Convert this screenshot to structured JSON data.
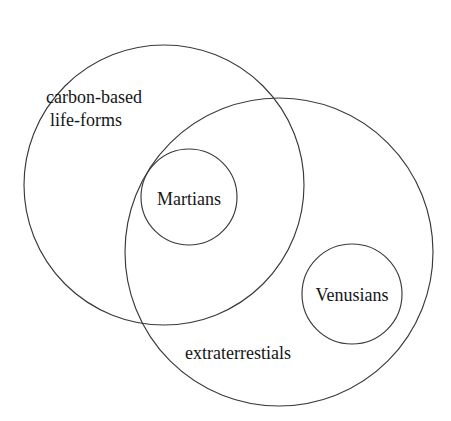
{
  "diagram": {
    "type": "euler-diagram",
    "title": "",
    "background_color": "#ffffff",
    "stroke_color": "#3a3a3a",
    "text_color": "#151515",
    "canvas": {
      "width": 451,
      "height": 421
    },
    "sets": [
      {
        "id": "carbon-based-life-forms",
        "label_lines": [
          "carbon-based",
          "life-forms"
        ],
        "label_text": "carbon-based life-forms",
        "cx": 164,
        "cy": 185,
        "r": 140,
        "label_x": 46,
        "label_y": 86
      },
      {
        "id": "extraterrestials",
        "label_lines": [
          "extraterrestials"
        ],
        "label_text": "extraterrestials",
        "cx": 279,
        "cy": 252,
        "r": 154,
        "label_x": 185,
        "label_y": 342
      },
      {
        "id": "martians",
        "label_lines": [
          "Martians"
        ],
        "label_text": "Martians",
        "cx": 189,
        "cy": 197,
        "r": 48,
        "label_x": 141,
        "label_y": 188
      },
      {
        "id": "venusians",
        "label_lines": [
          "Venusians"
        ],
        "label_text": "Venusians",
        "cx": 352,
        "cy": 294,
        "r": 50,
        "label_x": 300,
        "label_y": 284
      }
    ],
    "relations": [
      "Martians is a subset of carbon-based life-forms",
      "Martians is a subset of extraterrestials",
      "Venusians is a subset of extraterrestials",
      "carbon-based life-forms overlaps extraterrestials"
    ]
  }
}
